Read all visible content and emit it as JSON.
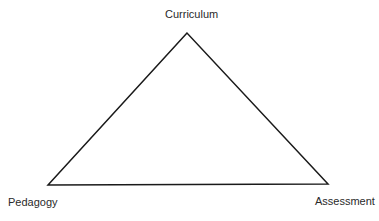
{
  "diagram": {
    "type": "triangle",
    "stroke_color": "#1a1a1a",
    "stroke_width": 1.5,
    "vertices": {
      "top": {
        "label": "Curriculum",
        "x": 187,
        "y": 33
      },
      "bottom_left": {
        "label": "Pedagogy",
        "x": 48,
        "y": 185
      },
      "bottom_right": {
        "label": "Assessment",
        "x": 328,
        "y": 184
      }
    }
  }
}
